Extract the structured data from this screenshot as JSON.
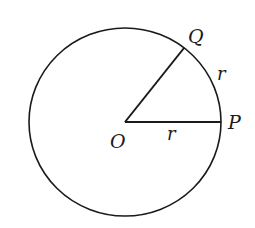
{
  "diagram": {
    "type": "circle-sector",
    "center": {
      "label": "O",
      "x": 125,
      "y": 122
    },
    "circle": {
      "rx": 96,
      "ry": 94,
      "stroke": "#1a1a1a"
    },
    "points": [
      {
        "label": "P",
        "x": 221,
        "y": 122
      },
      {
        "label": "Q",
        "x": 184,
        "y": 48
      }
    ],
    "segments": [
      {
        "from": "O",
        "to": "P",
        "label": "r"
      },
      {
        "from": "O",
        "to": "Q"
      }
    ],
    "arc": {
      "from": "P",
      "to": "Q",
      "label": "r"
    },
    "labels": {
      "O": "O",
      "P": "P",
      "Q": "Q",
      "radius": "r",
      "arc": "r"
    }
  }
}
